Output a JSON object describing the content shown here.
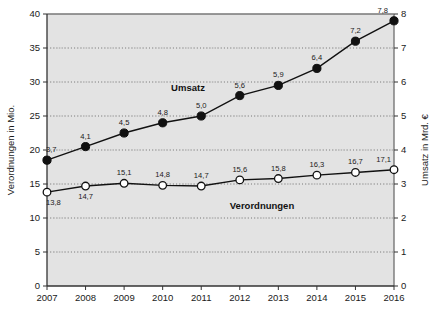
{
  "chart_data": {
    "type": "line",
    "title": "",
    "xlabel": "",
    "ylabel": "Verordnungen in Mio.",
    "y2label": "Umsatz in Mrd. €",
    "categories": [
      "2007",
      "2008",
      "2009",
      "2010",
      "2011",
      "2012",
      "2013",
      "2014",
      "2015",
      "2016"
    ],
    "ylim": [
      0,
      40
    ],
    "y2lim": [
      0,
      8
    ],
    "yticks": [
      "0",
      "5",
      "10",
      "15",
      "20",
      "25",
      "30",
      "35",
      "40"
    ],
    "y2ticks": [
      "0",
      "1",
      "2",
      "3",
      "4",
      "5",
      "6",
      "7",
      "8"
    ],
    "grid": true,
    "legend_position": "inline-annotations",
    "plot_background": "#e3e3e3",
    "series": [
      {
        "name": "Umsatz",
        "axis": "right",
        "marker": "filled-circle",
        "color": "#111111",
        "values": [
          3.7,
          4.1,
          4.5,
          4.8,
          5.0,
          5.6,
          5.9,
          6.4,
          7.2,
          7.8
        ],
        "labels": [
          "3,7",
          "4,1",
          "4,5",
          "4,8",
          "5,0",
          "5,6",
          "5,9",
          "6,4",
          "7,2",
          "7,8"
        ]
      },
      {
        "name": "Verordnungen",
        "axis": "left",
        "marker": "open-circle",
        "color": "#111111",
        "values": [
          13.8,
          14.7,
          15.1,
          14.8,
          14.7,
          15.6,
          15.8,
          16.3,
          16.7,
          17.1
        ],
        "labels": [
          "13,8",
          "14,7",
          "15,1",
          "14,8",
          "14,7",
          "15,6",
          "15,8",
          "16,3",
          "16,7",
          "17,1"
        ]
      }
    ],
    "annotations": [
      {
        "text": "Umsatz",
        "series": "Umsatz"
      },
      {
        "text": "Verordnungen",
        "series": "Verordnungen"
      }
    ]
  }
}
